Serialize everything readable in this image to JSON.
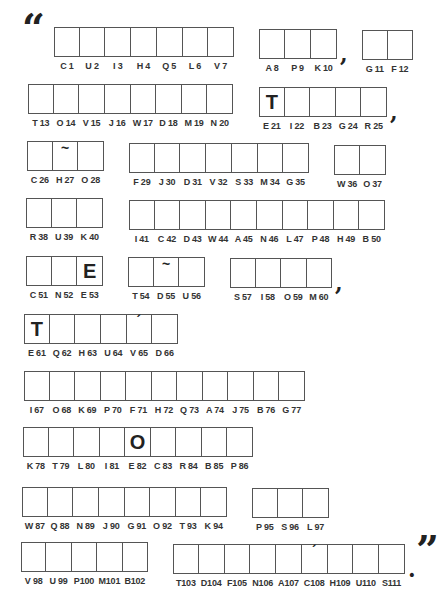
{
  "puzzle": {
    "open_quote": "“",
    "close_quote": "”",
    "groups": [
      {
        "x": 54,
        "y": 27,
        "w": 180,
        "cells": [
          {
            "label": "C 1"
          },
          {
            "label": "U 2"
          },
          {
            "label": "I 3"
          },
          {
            "label": "H 4"
          },
          {
            "label": "Q 5"
          },
          {
            "label": "L 6"
          },
          {
            "label": "V 7"
          }
        ]
      },
      {
        "x": 259,
        "y": 29,
        "w": 78,
        "cells": [
          {
            "label": "A 8"
          },
          {
            "label": "P 9"
          },
          {
            "label": "K 10"
          }
        ],
        "after": ","
      },
      {
        "x": 362,
        "y": 30,
        "w": 51,
        "cells": [
          {
            "label": "G 11"
          },
          {
            "label": "F 12"
          }
        ]
      },
      {
        "x": 28,
        "y": 84,
        "w": 205,
        "cells": [
          {
            "label": "T 13"
          },
          {
            "label": "O 14"
          },
          {
            "label": "V 15"
          },
          {
            "label": "J 16"
          },
          {
            "label": "W 17"
          },
          {
            "label": "D 18"
          },
          {
            "label": "M 19"
          },
          {
            "label": "N 20"
          }
        ]
      },
      {
        "x": 259,
        "y": 87,
        "w": 128,
        "cells": [
          {
            "label": "E 21",
            "given": "T"
          },
          {
            "label": "I 22"
          },
          {
            "label": "B 23"
          },
          {
            "label": "G 24"
          },
          {
            "label": "R 25"
          }
        ],
        "after": ","
      },
      {
        "x": 27,
        "y": 141,
        "w": 77,
        "cells": [
          {
            "label": "C 26"
          },
          {
            "label": "H 27",
            "mark": "~"
          },
          {
            "label": "O 28"
          }
        ]
      },
      {
        "x": 129,
        "y": 143,
        "w": 180,
        "cells": [
          {
            "label": "F 29"
          },
          {
            "label": "J 30"
          },
          {
            "label": "D 31"
          },
          {
            "label": "V 32"
          },
          {
            "label": "S 33"
          },
          {
            "label": "M 34"
          },
          {
            "label": "G 35"
          }
        ]
      },
      {
        "x": 334,
        "y": 145,
        "w": 52,
        "cells": [
          {
            "label": "W 36"
          },
          {
            "label": "O 37"
          }
        ]
      },
      {
        "x": 26,
        "y": 198,
        "w": 77,
        "cells": [
          {
            "label": "R 38"
          },
          {
            "label": "U 39"
          },
          {
            "label": "K 40"
          }
        ]
      },
      {
        "x": 129,
        "y": 200,
        "w": 256,
        "cells": [
          {
            "label": "I 41"
          },
          {
            "label": "C 42"
          },
          {
            "label": "D 43"
          },
          {
            "label": "W 44"
          },
          {
            "label": "A 45"
          },
          {
            "label": "N 46"
          },
          {
            "label": "L 47"
          },
          {
            "label": "P 48"
          },
          {
            "label": "H 49"
          },
          {
            "label": "B 50"
          }
        ]
      },
      {
        "x": 26,
        "y": 256,
        "w": 77,
        "cells": [
          {
            "label": "C 51"
          },
          {
            "label": "N 52"
          },
          {
            "label": "E 53",
            "given": "E"
          }
        ]
      },
      {
        "x": 128,
        "y": 257,
        "w": 77,
        "cells": [
          {
            "label": "T 54"
          },
          {
            "label": "D 55",
            "mark": "~"
          },
          {
            "label": "U 56"
          }
        ]
      },
      {
        "x": 230,
        "y": 258,
        "w": 102,
        "cells": [
          {
            "label": "S 57"
          },
          {
            "label": "I 58"
          },
          {
            "label": "O 59"
          },
          {
            "label": "M 60"
          }
        ],
        "after": ","
      },
      {
        "x": 24,
        "y": 314,
        "w": 154,
        "cells": [
          {
            "label": "E 61",
            "given": "T"
          },
          {
            "label": "Q 62"
          },
          {
            "label": "H 63"
          },
          {
            "label": "U 64"
          },
          {
            "label": "V 65",
            "mark": "´"
          },
          {
            "label": "D 66"
          }
        ]
      },
      {
        "x": 24,
        "y": 371,
        "w": 281,
        "cells": [
          {
            "label": "I 67"
          },
          {
            "label": "O 68"
          },
          {
            "label": "K 69"
          },
          {
            "label": "P 70"
          },
          {
            "label": "F 71"
          },
          {
            "label": "H 72"
          },
          {
            "label": "Q 73"
          },
          {
            "label": "A 74"
          },
          {
            "label": "J 75"
          },
          {
            "label": "B 76"
          },
          {
            "label": "G 77"
          }
        ]
      },
      {
        "x": 23,
        "y": 427,
        "w": 230,
        "cells": [
          {
            "label": "K 78"
          },
          {
            "label": "T 79"
          },
          {
            "label": "L 80"
          },
          {
            "label": "I 81"
          },
          {
            "label": "E 82",
            "given": "O"
          },
          {
            "label": "C 83"
          },
          {
            "label": "R 84"
          },
          {
            "label": "B 85"
          },
          {
            "label": "P 86"
          }
        ]
      },
      {
        "x": 22,
        "y": 487,
        "w": 205,
        "cells": [
          {
            "label": "W 87"
          },
          {
            "label": "Q 88"
          },
          {
            "label": "N 89"
          },
          {
            "label": "J 90"
          },
          {
            "label": "G 91"
          },
          {
            "label": "O 92"
          },
          {
            "label": "T 93"
          },
          {
            "label": "K 94"
          }
        ]
      },
      {
        "x": 252,
        "y": 488,
        "w": 77,
        "cells": [
          {
            "label": "P 95"
          },
          {
            "label": "S 96"
          },
          {
            "label": "L 97"
          }
        ]
      },
      {
        "x": 21,
        "y": 542,
        "w": 127,
        "cells": [
          {
            "label": "V 98"
          },
          {
            "label": "U 99"
          },
          {
            "label": "P100"
          },
          {
            "label": "M101"
          },
          {
            "label": "B102"
          }
        ]
      },
      {
        "x": 173,
        "y": 544,
        "w": 232,
        "cells": [
          {
            "label": "T103"
          },
          {
            "label": "D104"
          },
          {
            "label": "F105"
          },
          {
            "label": "N106"
          },
          {
            "label": "A107"
          },
          {
            "label": "C108",
            "mark": "´"
          },
          {
            "label": "H109"
          },
          {
            "label": "U110"
          },
          {
            "label": "S111"
          }
        ],
        "after": "."
      }
    ]
  }
}
